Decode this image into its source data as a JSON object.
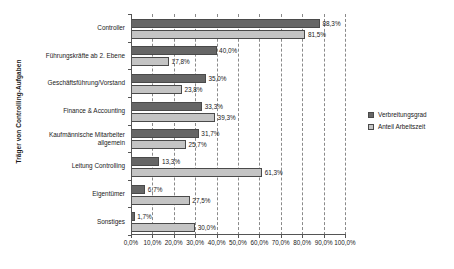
{
  "chart_data": {
    "type": "bar",
    "orientation": "horizontal",
    "title": "",
    "xlabel": "",
    "ylabel": "Träger von Controlling-Aufgaben",
    "xlim": [
      0,
      100
    ],
    "grid": true,
    "grid_axis": "x",
    "legend_position": "right",
    "categories": [
      "Controller",
      "Führungskräfte ab 2. Ebene",
      "Geschäftsführung/Vorstand",
      "Finance & Accounting",
      "Kaufmännische Mitarbeiter allgemein",
      "Leitung Controlling",
      "Eigentümer",
      "Sonstiges"
    ],
    "category_lines": [
      [
        "Controller"
      ],
      [
        "Führungskräfte ab 2. Ebene"
      ],
      [
        "Geschäftsführung/Vorstand"
      ],
      [
        "Finance & Accounting"
      ],
      [
        "Kaufmännische Mitarbeiter",
        "allgemein"
      ],
      [
        "Leitung Controlling"
      ],
      [
        "Eigentümer"
      ],
      [
        "Sonstiges"
      ]
    ],
    "series": [
      {
        "name": "Verbreitungsgrad",
        "color": "#666666",
        "values": [
          88.3,
          40.0,
          35.0,
          33.3,
          31.7,
          13.3,
          6.7,
          1.7
        ],
        "labels": [
          "88,3%",
          "40,0%",
          "35,0%",
          "33,3%",
          "31,7%",
          "13,3%",
          "6,7%",
          "1,7%"
        ]
      },
      {
        "name": "Anteil Arbeitszeit",
        "color": "#c4c4c4",
        "values": [
          81.5,
          17.8,
          23.8,
          39.3,
          25.7,
          61.3,
          27.5,
          30.0
        ],
        "labels": [
          "81,5%",
          "17,8%",
          "23,8%",
          "39,3%",
          "25,7%",
          "61,3%",
          "27,5%",
          "30,0%"
        ]
      }
    ],
    "xticks": [
      0,
      10,
      20,
      30,
      40,
      50,
      60,
      70,
      80,
      90,
      100
    ],
    "xtick_labels": [
      "0,0%",
      "10,0%",
      "20,0%",
      "30,0%",
      "40,0%",
      "50,0%",
      "60,0%",
      "70,0%",
      "80,0%",
      "90,0%",
      "100,0%"
    ]
  },
  "legend": {
    "items": [
      {
        "label": "Verbreitungsgrad",
        "color": "#666666"
      },
      {
        "label": "Anteil Arbeitszeit",
        "color": "#c4c4c4"
      }
    ]
  },
  "axes": {
    "y_title": "Träger von Controlling-Aufgaben"
  }
}
